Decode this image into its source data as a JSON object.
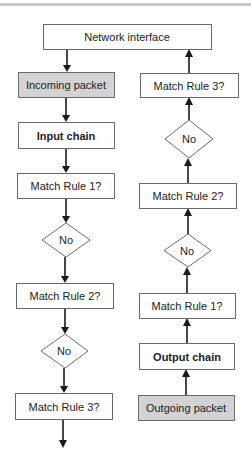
{
  "diagram": {
    "nodes": {
      "network_interface": "Network interface",
      "incoming_packet": "Incoming packet",
      "input_chain": "Input chain",
      "in_rule1": "Match Rule 1?",
      "in_no1": "No",
      "in_rule2": "Match Rule 2?",
      "in_no2": "No",
      "in_rule3": "Match Rule 3?",
      "outgoing_packet": "Outgoing packet",
      "output_chain": "Output chain",
      "out_rule1": "Match Rule 1?",
      "out_no1": "No",
      "out_rule2": "Match Rule 2?",
      "out_no2": "No",
      "out_rule3": "Match Rule 3?"
    },
    "edges": [
      {
        "from": "network_interface",
        "to": "incoming_packet"
      },
      {
        "from": "incoming_packet",
        "to": "input_chain"
      },
      {
        "from": "input_chain",
        "to": "in_rule1"
      },
      {
        "from": "in_rule1",
        "to": "in_no1"
      },
      {
        "from": "in_no1",
        "to": "in_rule2"
      },
      {
        "from": "in_rule2",
        "to": "in_no2"
      },
      {
        "from": "in_no2",
        "to": "in_rule3"
      },
      {
        "from": "outgoing_packet",
        "to": "output_chain"
      },
      {
        "from": "output_chain",
        "to": "out_rule1"
      },
      {
        "from": "out_rule1",
        "to": "out_no1"
      },
      {
        "from": "out_no1",
        "to": "out_rule2"
      },
      {
        "from": "out_rule2",
        "to": "out_no2"
      },
      {
        "from": "out_no2",
        "to": "out_rule3"
      },
      {
        "from": "out_rule3",
        "to": "network_interface"
      }
    ],
    "colors": {
      "shaded_fill": "#d3d3d3",
      "border": "#6a6a6a",
      "arrow": "#1a1a1a"
    }
  }
}
